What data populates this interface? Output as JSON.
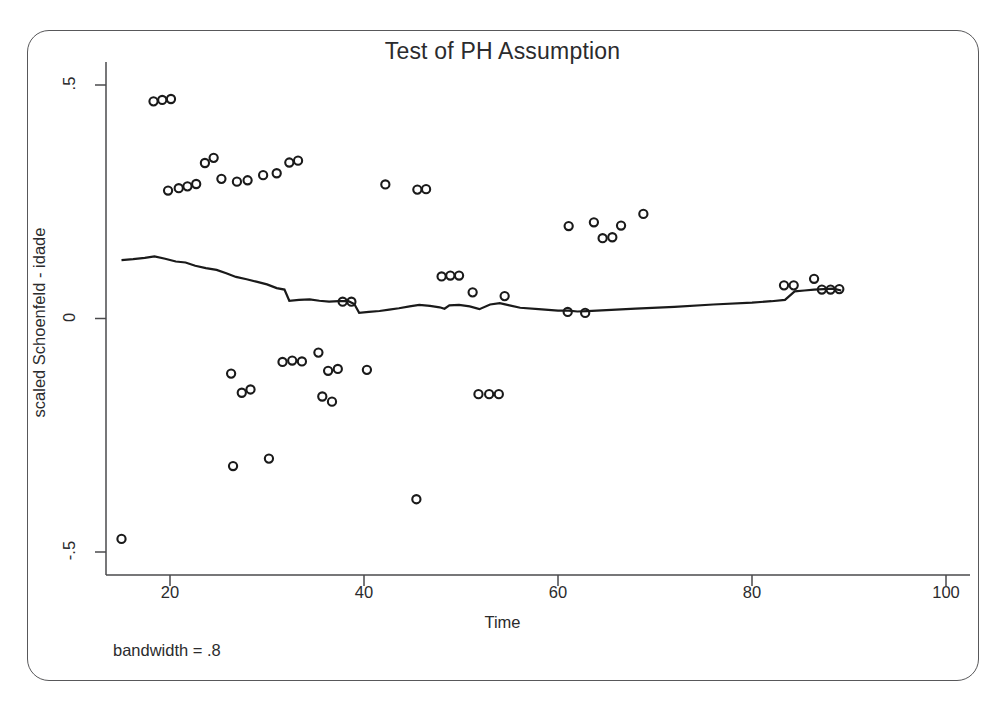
{
  "chart_data": {
    "type": "scatter",
    "title": "Test of PH Assumption",
    "xlabel": "Time",
    "ylabel": "scaled Schoenfeld - idade",
    "annotation": "bandwidth = .8",
    "xlim": [
      14,
      103
    ],
    "ylim": [
      -0.52,
      0.53
    ],
    "xticks": [
      20,
      40,
      60,
      80,
      100
    ],
    "xticklabels": [
      "20",
      "40",
      "60",
      "80",
      "100"
    ],
    "yticks": [
      0.5,
      0,
      -0.5
    ],
    "yticklabels": [
      ".5",
      "0",
      "-.5"
    ],
    "grid": false,
    "legend": null,
    "marker": "open-circle",
    "marker_color": "#1a1a1a",
    "line_color": "#1a1a1a",
    "points": [
      {
        "x": 15.0,
        "y": -0.472
      },
      {
        "x": 18.3,
        "y": 0.465
      },
      {
        "x": 19.2,
        "y": 0.468
      },
      {
        "x": 20.1,
        "y": 0.47
      },
      {
        "x": 19.8,
        "y": 0.274
      },
      {
        "x": 20.9,
        "y": 0.279
      },
      {
        "x": 21.8,
        "y": 0.283
      },
      {
        "x": 22.7,
        "y": 0.288
      },
      {
        "x": 23.6,
        "y": 0.333
      },
      {
        "x": 24.5,
        "y": 0.344
      },
      {
        "x": 25.3,
        "y": 0.299
      },
      {
        "x": 26.9,
        "y": 0.293
      },
      {
        "x": 28.0,
        "y": 0.296
      },
      {
        "x": 29.6,
        "y": 0.307
      },
      {
        "x": 31.0,
        "y": 0.311
      },
      {
        "x": 32.3,
        "y": 0.334
      },
      {
        "x": 33.2,
        "y": 0.338
      },
      {
        "x": 42.2,
        "y": 0.287
      },
      {
        "x": 45.5,
        "y": 0.276
      },
      {
        "x": 46.4,
        "y": 0.277
      },
      {
        "x": 26.3,
        "y": -0.118
      },
      {
        "x": 27.4,
        "y": -0.159
      },
      {
        "x": 28.3,
        "y": -0.152
      },
      {
        "x": 30.2,
        "y": -0.3
      },
      {
        "x": 26.5,
        "y": -0.316
      },
      {
        "x": 31.6,
        "y": -0.093
      },
      {
        "x": 32.6,
        "y": -0.09
      },
      {
        "x": 33.6,
        "y": -0.092
      },
      {
        "x": 35.3,
        "y": -0.073
      },
      {
        "x": 36.3,
        "y": -0.112
      },
      {
        "x": 37.3,
        "y": -0.108
      },
      {
        "x": 35.7,
        "y": -0.167
      },
      {
        "x": 36.7,
        "y": -0.178
      },
      {
        "x": 40.3,
        "y": -0.11
      },
      {
        "x": 45.4,
        "y": -0.387
      },
      {
        "x": 51.8,
        "y": -0.162
      },
      {
        "x": 52.9,
        "y": -0.162
      },
      {
        "x": 53.9,
        "y": -0.162
      },
      {
        "x": 37.8,
        "y": 0.036
      },
      {
        "x": 38.7,
        "y": 0.036
      },
      {
        "x": 48.0,
        "y": 0.09
      },
      {
        "x": 48.9,
        "y": 0.092
      },
      {
        "x": 49.8,
        "y": 0.092
      },
      {
        "x": 51.2,
        "y": 0.056
      },
      {
        "x": 54.5,
        "y": 0.048
      },
      {
        "x": 61.0,
        "y": 0.014
      },
      {
        "x": 62.8,
        "y": 0.012
      },
      {
        "x": 61.1,
        "y": 0.198
      },
      {
        "x": 63.7,
        "y": 0.206
      },
      {
        "x": 64.6,
        "y": 0.172
      },
      {
        "x": 65.6,
        "y": 0.174
      },
      {
        "x": 66.5,
        "y": 0.199
      },
      {
        "x": 68.8,
        "y": 0.224
      },
      {
        "x": 83.3,
        "y": 0.071
      },
      {
        "x": 84.3,
        "y": 0.071
      },
      {
        "x": 86.4,
        "y": 0.085
      },
      {
        "x": 87.2,
        "y": 0.062
      },
      {
        "x": 88.1,
        "y": 0.062
      },
      {
        "x": 89.0,
        "y": 0.063
      }
    ],
    "smooth_line": {
      "label": "lowess smooth",
      "x": [
        15.0,
        16.2,
        17.4,
        18.4,
        19.5,
        20.6,
        21.6,
        22.6,
        23.7,
        24.8,
        25.8,
        26.8,
        27.9,
        28.9,
        30.0,
        31.0,
        31.8,
        32.3,
        33.3,
        34.4,
        35.4,
        36.4,
        37.4,
        38.4,
        39.0,
        39.5,
        40.5,
        41.6,
        42.6,
        43.6,
        44.7,
        45.7,
        46.8,
        47.8,
        48.3,
        48.8,
        49.8,
        50.9,
        51.9,
        53.0,
        54.0,
        55.0,
        56.1,
        58.0,
        60.0,
        61.1,
        62.0,
        63.0,
        65.0,
        68.0,
        72.0,
        76.0,
        80.0,
        82.0,
        83.4,
        84.4,
        85.4,
        86.4,
        87.4,
        88.4,
        89.2
      ],
      "y": [
        0.125,
        0.127,
        0.13,
        0.133,
        0.128,
        0.122,
        0.12,
        0.113,
        0.108,
        0.104,
        0.097,
        0.089,
        0.084,
        0.079,
        0.073,
        0.065,
        0.062,
        0.038,
        0.04,
        0.041,
        0.038,
        0.036,
        0.037,
        0.037,
        0.031,
        0.012,
        0.014,
        0.016,
        0.019,
        0.022,
        0.026,
        0.029,
        0.027,
        0.024,
        0.021,
        0.028,
        0.029,
        0.026,
        0.02,
        0.03,
        0.033,
        0.028,
        0.023,
        0.02,
        0.017,
        0.017,
        0.015,
        0.016,
        0.018,
        0.021,
        0.025,
        0.03,
        0.034,
        0.037,
        0.04,
        0.058,
        0.06,
        0.062,
        0.063,
        0.064,
        0.06
      ]
    }
  },
  "axes": {
    "x_tick_labels": [
      "20",
      "40",
      "60",
      "80",
      "100"
    ],
    "y_tick_labels": [
      ".5",
      "0",
      "-.5"
    ]
  }
}
